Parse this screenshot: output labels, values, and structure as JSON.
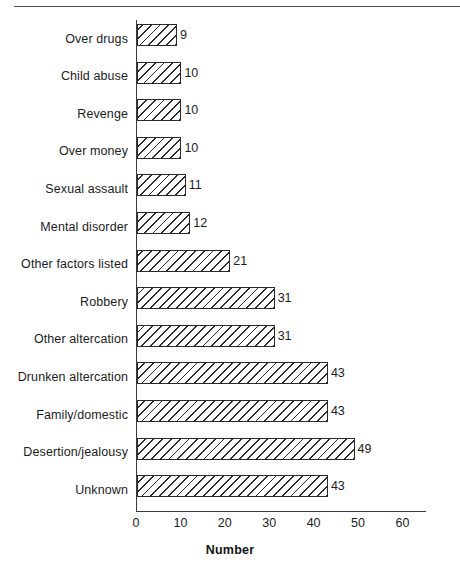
{
  "chart_data": {
    "type": "bar",
    "orientation": "horizontal",
    "title": "",
    "xlabel": "Number",
    "ylabel": "",
    "xlim": [
      0,
      65
    ],
    "xticks": [
      0,
      10,
      20,
      30,
      40,
      50,
      60
    ],
    "grid": false,
    "legend": null,
    "bar_style": {
      "fill": "diagonal-hatch",
      "edge_color": "#2a2a2a",
      "face_color": "#ffffff"
    },
    "categories": [
      "Over drugs",
      "Child abuse",
      "Revenge",
      "Over money",
      "Sexual assault",
      "Mental disorder",
      "Other factors listed",
      "Robbery",
      "Other altercation",
      "Drunken altercation",
      "Family/domestic",
      "Desertion/jealousy",
      "Unknown"
    ],
    "values": [
      9,
      10,
      10,
      10,
      11,
      12,
      21,
      31,
      31,
      43,
      43,
      49,
      43
    ],
    "data_labels": [
      "9",
      "10",
      "10",
      "10",
      "11",
      "12",
      "21",
      "31",
      "31",
      "43",
      "43",
      "49",
      "43"
    ],
    "tick_labels": [
      "0",
      "10",
      "20",
      "30",
      "40",
      "50",
      "60"
    ]
  },
  "figure": {
    "background_color": "#ffffff",
    "axis_color": "#3a3a3a",
    "text_color": "#1c1c1c"
  }
}
